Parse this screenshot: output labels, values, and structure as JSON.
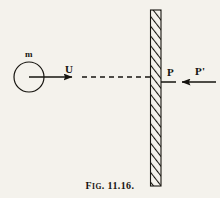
{
  "figure": {
    "caption_prefix": "F",
    "caption_smallcaps": "IG",
    "caption_number": ". 11.16.",
    "caption_full": "Fig. 11.16.",
    "background_color": "#f4f2ec",
    "ink_color": "#16140f"
  },
  "labels": {
    "mass": "m",
    "velocity": "U",
    "force_wall_on_body": "P",
    "force_body_on_wall": "P'"
  },
  "elements": {
    "body_circle": {
      "name": "mass-circle",
      "center_x": 29,
      "center_y": 77,
      "radius": 15
    },
    "velocity_arrow": {
      "name": "velocity-arrow",
      "from_x": 29,
      "from_y": 77,
      "to_x": 79,
      "to_y": 77,
      "style": "solid",
      "direction": "right"
    },
    "trajectory_line": {
      "name": "trajectory-dashed-line",
      "from_x": 80,
      "from_y": 77,
      "to_x": 152,
      "to_y": 77,
      "style": "dashed",
      "direction": "right"
    },
    "wall": {
      "name": "hatched-wall",
      "x": 150,
      "y": 10,
      "width": 11,
      "height": 176,
      "hatch": "diagonal"
    },
    "reaction_arrow": {
      "name": "reaction-force-arrow",
      "from_x": 216,
      "from_y": 82,
      "to_x": 160,
      "to_y": 82,
      "style": "solid",
      "direction": "left"
    }
  }
}
